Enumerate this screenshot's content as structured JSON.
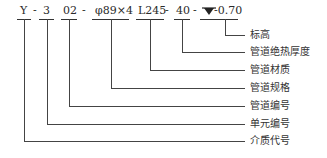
{
  "diagram": {
    "code_parts": [
      {
        "id": "medium",
        "text": "Y"
      },
      {
        "id": "unit",
        "text": "3"
      },
      {
        "id": "pipe_no",
        "text": "02"
      },
      {
        "id": "spec",
        "text": "φ89×4"
      },
      {
        "id": "material",
        "text": "L245"
      },
      {
        "id": "insulation",
        "text": "40"
      },
      {
        "id": "elevation",
        "text": "-0.70"
      }
    ],
    "separator": "-",
    "elevation_symbol": "triangle-down-icon",
    "labels": [
      {
        "id": "elevation",
        "text": "标高"
      },
      {
        "id": "insulation",
        "text": "管道绝热厚度"
      },
      {
        "id": "material",
        "text": "管道材质"
      },
      {
        "id": "spec",
        "text": "管道规格"
      },
      {
        "id": "pipe_no",
        "text": "管道编号"
      },
      {
        "id": "unit",
        "text": "单元编号"
      },
      {
        "id": "medium",
        "text": "介质代号"
      }
    ]
  }
}
